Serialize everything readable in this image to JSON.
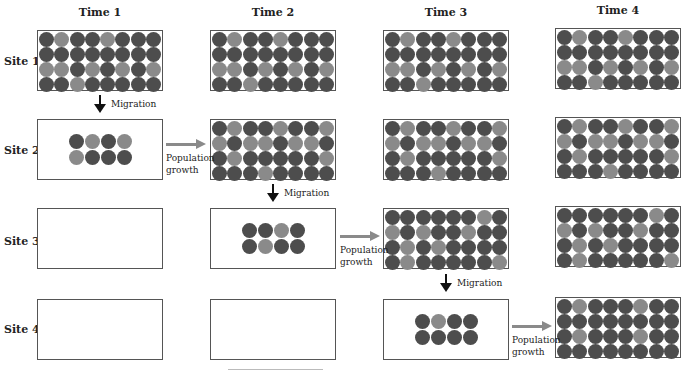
{
  "headers": [
    "Time 1",
    "Time 2",
    "Time 3",
    "Time 4"
  ],
  "sites": [
    "Site 1",
    "Site 2",
    "Site 3",
    "Site 4"
  ],
  "labels": {
    "migration": "Migration",
    "growth_line1": "Population",
    "growth_line2": "growth"
  },
  "colors": {
    "dark": "#4d4d4d",
    "light": "#8a8a8a",
    "growth_arrow": "#8a8a8a",
    "migration_arrow": "#111111"
  },
  "patterns": {
    "site1_full": [
      "DLDDLDDD",
      "DDDDDDDD",
      "LLDLDLDL",
      "DDLDDDDD"
    ],
    "site2_full": [
      "DLDDLDDL",
      "LDLLDLLD",
      "DLDDDDDL",
      "DDDLDDDD"
    ],
    "site3_full": [
      "DDDDDDLD",
      "LDLDDLDD",
      "DLDLDDDD",
      "DLDDDDDL"
    ],
    "site4_full": [
      "DLDDDLDD",
      "DDDDDDDD",
      "DLDDDLDD",
      "DDDDDDDD"
    ],
    "site2_founders": [
      "DLDL",
      "LDDD"
    ],
    "site3_founders": [
      "DDLD",
      "DLDD"
    ],
    "site4_founders": [
      "DLDD",
      "DDDD"
    ]
  },
  "cells": [
    {
      "site": 1,
      "time": 1,
      "type": "full",
      "pattern": "site1_full"
    },
    {
      "site": 1,
      "time": 2,
      "type": "full",
      "pattern": "site1_full"
    },
    {
      "site": 1,
      "time": 3,
      "type": "full",
      "pattern": "site1_full"
    },
    {
      "site": 1,
      "time": 4,
      "type": "full",
      "pattern": "site1_full"
    },
    {
      "site": 2,
      "time": 1,
      "type": "founders",
      "pattern": "site2_founders"
    },
    {
      "site": 2,
      "time": 2,
      "type": "full",
      "pattern": "site2_full"
    },
    {
      "site": 2,
      "time": 3,
      "type": "full",
      "pattern": "site2_full"
    },
    {
      "site": 2,
      "time": 4,
      "type": "full",
      "pattern": "site2_full"
    },
    {
      "site": 3,
      "time": 1,
      "type": "empty"
    },
    {
      "site": 3,
      "time": 2,
      "type": "founders",
      "pattern": "site3_founders"
    },
    {
      "site": 3,
      "time": 3,
      "type": "full",
      "pattern": "site3_full"
    },
    {
      "site": 3,
      "time": 4,
      "type": "full",
      "pattern": "site3_full"
    },
    {
      "site": 4,
      "time": 1,
      "type": "empty"
    },
    {
      "site": 4,
      "time": 2,
      "type": "empty"
    },
    {
      "site": 4,
      "time": 3,
      "type": "founders",
      "pattern": "site4_founders"
    },
    {
      "site": 4,
      "time": 4,
      "type": "full",
      "pattern": "site4_full"
    }
  ]
}
